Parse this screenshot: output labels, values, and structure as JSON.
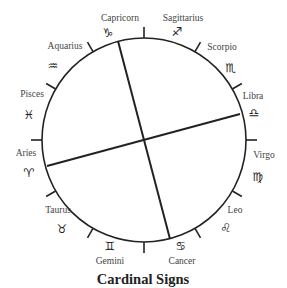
{
  "title": "Cardinal Signs",
  "wheel": {
    "center": [
      144,
      140
    ],
    "radius": 102,
    "stroke_color": "#222222",
    "tick_angles_deg": [
      0,
      30,
      60,
      90,
      120,
      150,
      180,
      210,
      240,
      270,
      300,
      330
    ],
    "axes": [
      {
        "name": "axis-capricorn-cancer",
        "from": [
          118,
          41
        ],
        "to": [
          170,
          239
        ]
      },
      {
        "name": "axis-aries-libra",
        "from": [
          47,
          166
        ],
        "to": [
          240,
          114
        ]
      }
    ]
  },
  "signs": [
    {
      "name": "Capricorn",
      "glyph": "♑",
      "label_pos": [
        120,
        18
      ],
      "glyph_pos": [
        108,
        33
      ]
    },
    {
      "name": "Sagittarius",
      "glyph": "♐",
      "label_pos": [
        183,
        18
      ],
      "glyph_pos": [
        177,
        32
      ]
    },
    {
      "name": "Scorpio",
      "glyph": "♏",
      "label_pos": [
        222,
        47
      ],
      "glyph_pos": [
        231,
        68
      ]
    },
    {
      "name": "Libra",
      "glyph": "♎",
      "label_pos": [
        253,
        96
      ],
      "glyph_pos": [
        254,
        113
      ]
    },
    {
      "name": "Virgo",
      "glyph": "♍",
      "label_pos": [
        264,
        155
      ],
      "glyph_pos": [
        258,
        177
      ]
    },
    {
      "name": "Leo",
      "glyph": "♌",
      "label_pos": [
        235,
        210
      ],
      "glyph_pos": [
        226,
        228
      ]
    },
    {
      "name": "Cancer",
      "glyph": "♋",
      "label_pos": [
        182,
        261
      ],
      "glyph_pos": [
        181,
        246
      ]
    },
    {
      "name": "Gemini",
      "glyph": "♊",
      "label_pos": [
        110,
        261
      ],
      "glyph_pos": [
        110,
        246
      ]
    },
    {
      "name": "Taurus",
      "glyph": "♉",
      "label_pos": [
        58,
        210
      ],
      "glyph_pos": [
        62,
        229
      ]
    },
    {
      "name": "Aries",
      "glyph": "♈",
      "label_pos": [
        26,
        153
      ],
      "glyph_pos": [
        29,
        173
      ]
    },
    {
      "name": "Pisces",
      "glyph": "♓",
      "label_pos": [
        32,
        94
      ],
      "glyph_pos": [
        29,
        115
      ]
    },
    {
      "name": "Aquarius",
      "glyph": "♒",
      "label_pos": [
        65,
        46
      ],
      "glyph_pos": [
        53,
        66
      ]
    }
  ]
}
